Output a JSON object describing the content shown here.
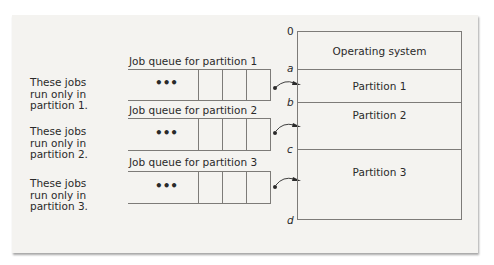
{
  "diagram": {
    "descriptions": [
      {
        "lines": [
          "These jobs",
          "run only in",
          "partition 1."
        ]
      },
      {
        "lines": [
          "These jobs",
          "run only in",
          "partition 2."
        ]
      },
      {
        "lines": [
          "These jobs",
          "run only in",
          "partition 3."
        ]
      }
    ],
    "queues": [
      {
        "label": "Job queue for partition 1",
        "ellipsis": "•••"
      },
      {
        "label": "Job queue for partition 2",
        "ellipsis": "•••"
      },
      {
        "label": "Job queue for partition 3",
        "ellipsis": "•••"
      }
    ],
    "memory": {
      "addresses": [
        "0",
        "a",
        "b",
        "c",
        "d"
      ],
      "segments": [
        {
          "label": "Operating system"
        },
        {
          "label": "Partition 1"
        },
        {
          "label": "Partition 2"
        },
        {
          "label": "Partition 3"
        }
      ]
    },
    "colors": {
      "background": "#f4f3f0",
      "lines": "#7d7b78",
      "text": "#2a2a2a"
    }
  }
}
